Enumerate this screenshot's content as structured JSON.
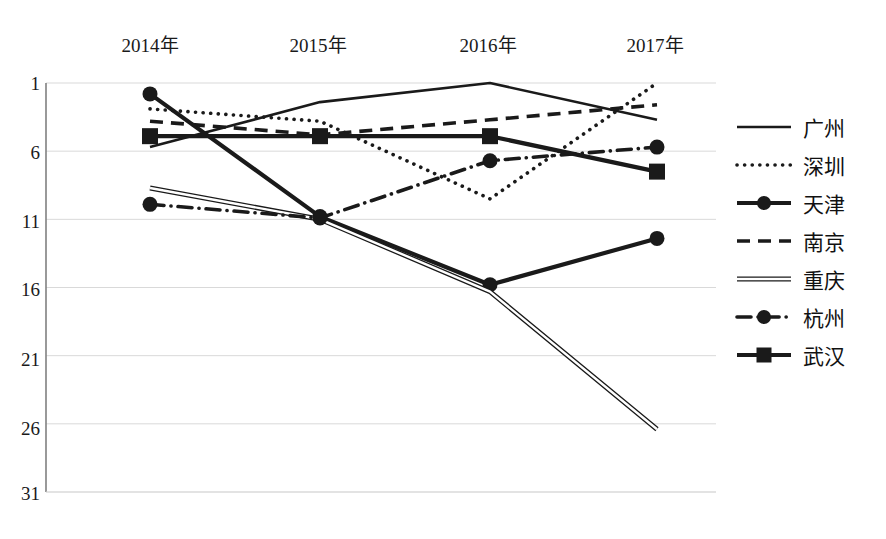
{
  "chart_data": {
    "type": "line",
    "title": "",
    "xlabel": "",
    "ylabel": "",
    "categories": [
      "2014年",
      "2015年",
      "2016年",
      "2017年"
    ],
    "ytick_labels": [
      "1",
      "6",
      "11",
      "16",
      "21",
      "26",
      "31"
    ],
    "ytick_values": [
      1,
      6,
      11,
      16,
      21,
      26,
      31
    ],
    "ylim": [
      1,
      31
    ],
    "y_inverted": true,
    "grid": true,
    "legend_position": "right",
    "series": [
      {
        "name": "广州",
        "style": "solid",
        "marker": "none",
        "values": [
          5.7,
          2.4,
          1.0,
          3.7
        ]
      },
      {
        "name": "深圳",
        "style": "dotted",
        "marker": "none",
        "values": [
          2.9,
          3.8,
          9.5,
          1.0
        ]
      },
      {
        "name": "天津",
        "style": "solid-thick",
        "marker": "circle",
        "values": [
          1.8,
          10.8,
          15.8,
          12.4
        ]
      },
      {
        "name": "南京",
        "style": "dashed",
        "marker": "none",
        "values": [
          3.8,
          4.8,
          3.7,
          2.6
        ]
      },
      {
        "name": "重庆",
        "style": "double",
        "marker": "none",
        "values": [
          8.7,
          11.0,
          16.3,
          26.4
        ]
      },
      {
        "name": "杭州",
        "style": "dash-dot",
        "marker": "circle",
        "values": [
          9.9,
          10.9,
          6.7,
          5.7
        ]
      },
      {
        "name": "武汉",
        "style": "solid-thick",
        "marker": "square",
        "values": [
          4.9,
          4.9,
          4.9,
          7.5
        ]
      }
    ]
  },
  "colors": {
    "line": "#1a1a1a",
    "grid": "#d9d9d9",
    "axis": "#808080",
    "background": "#ffffff"
  }
}
